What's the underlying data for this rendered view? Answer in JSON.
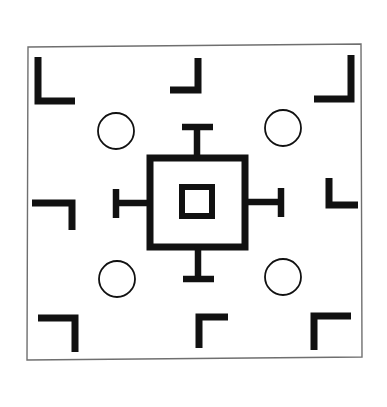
{
  "figure": {
    "canvas_width": 387,
    "canvas_height": 407
  },
  "style": {
    "background_color": "#ffffff",
    "ink_color": "#111111",
    "frame_stroke_color": "#6f6f6f",
    "frame_stroke_width": 1.4,
    "bracket_stroke_width": 7,
    "circle_stroke_width": 1.8,
    "center_square_stroke_width": 7,
    "inner_square_stroke_width": 6,
    "arm_stroke_width": 6.5
  },
  "outer_frame": {
    "label": "outer rectangular frame",
    "corners": {
      "top_left": [
        28,
        47
      ],
      "top_right": [
        361,
        44
      ],
      "bottom_right": [
        362,
        357
      ],
      "bottom_left": [
        27,
        360
      ]
    }
  },
  "corner_brackets": [
    {
      "name": "top-left-bracket",
      "orientation": "vertical-left-horizontal-bottom",
      "points": "38,57 38,101 75,101",
      "corner_cap": "vertical bar descends then turns right"
    },
    {
      "name": "top-right-bracket",
      "orientation": "vertical-right-horizontal-bottom",
      "points": "351,55 351,99 314,99",
      "corner_cap": "vertical bar descends then turns left"
    },
    {
      "name": "bottom-left-bracket",
      "orientation": "horizontal-top-vertical-right",
      "points": "38,318 75,318 75,352",
      "corner_cap": "horizontal bar then turns down"
    },
    {
      "name": "bottom-right-bracket",
      "orientation": "horizontal-top-vertical-left",
      "points": "351,316 314,316 314,350",
      "corner_cap": "horizontal bar then turns down"
    }
  ],
  "edge_brackets": [
    {
      "name": "top-center-bracket",
      "orientation": "vertical-right-horizontal-bottom-left",
      "points": "198,58 198,90 170,90"
    },
    {
      "name": "bottom-center-bracket",
      "orientation": "horizontal-top-right-vertical-down",
      "points": "199,348 199,317 228,317"
    },
    {
      "name": "left-center-bracket",
      "orientation": "horizontal-top-vertical-right-down",
      "points": "32,203 72,203 72,230"
    },
    {
      "name": "right-center-bracket",
      "orientation": "vertical-left-horizontal-bottom-right",
      "points": "329,178 329,205 358,205"
    }
  ],
  "circles": [
    {
      "name": "circle-top-left",
      "cx": 116,
      "cy": 131,
      "r": 18
    },
    {
      "name": "circle-top-right",
      "cx": 283,
      "cy": 128,
      "r": 18
    },
    {
      "name": "circle-bottom-left",
      "cx": 117,
      "cy": 279,
      "r": 18
    },
    {
      "name": "circle-bottom-right",
      "cx": 283,
      "cy": 277,
      "r": 18
    }
  ],
  "center_target": {
    "name": "central-square-target",
    "outer_square": {
      "x": 150,
      "y": 158,
      "width": 95,
      "height": 89
    },
    "inner_square": {
      "x": 182,
      "y": 187,
      "width": 30,
      "height": 29
    },
    "arms": [
      {
        "name": "arm-top",
        "direction": "up",
        "stem": {
          "x1": 197,
          "y1": 158,
          "x2": 197,
          "y2": 127
        },
        "cap": {
          "x1": 182,
          "y1": 127,
          "x2": 213,
          "y2": 127
        }
      },
      {
        "name": "arm-bottom",
        "direction": "down",
        "stem": {
          "x1": 198,
          "y1": 247,
          "x2": 198,
          "y2": 279
        },
        "cap": {
          "x1": 183,
          "y1": 279,
          "x2": 214,
          "y2": 279
        }
      },
      {
        "name": "arm-left",
        "direction": "left",
        "stem": {
          "x1": 150,
          "y1": 203,
          "x2": 116,
          "y2": 203
        },
        "cap": {
          "x1": 116,
          "y1": 189,
          "x2": 116,
          "y2": 218
        }
      },
      {
        "name": "arm-right",
        "direction": "right",
        "stem": {
          "x1": 245,
          "y1": 202,
          "x2": 281,
          "y2": 202
        },
        "cap": {
          "x1": 281,
          "y1": 188,
          "x2": 281,
          "y2": 217
        }
      }
    ]
  }
}
